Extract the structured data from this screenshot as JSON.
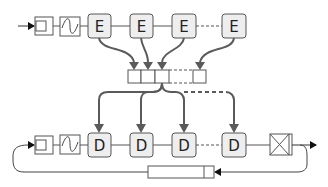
{
  "colors": {
    "stroke": "#555555",
    "arrow": "#5a5a5a",
    "node_fill": "#eeeeee",
    "box_fill": "#ffffff",
    "background": "#ffffff",
    "text": "#222222"
  },
  "encoder_row": {
    "input_block": "register",
    "filter_block": "sine-wave",
    "nodes": [
      {
        "label": "E"
      },
      {
        "label": "E"
      },
      {
        "label": "E"
      },
      {
        "label": "E"
      }
    ]
  },
  "buffer": {
    "cells_visible": 4,
    "gap": "dashed"
  },
  "decoder_row": {
    "input_block": "register",
    "filter_block": "sine-wave",
    "nodes": [
      {
        "label": "D"
      },
      {
        "label": "D"
      },
      {
        "label": "D"
      },
      {
        "label": "D"
      }
    ],
    "output_block": "crossed-box"
  },
  "feedback": {
    "delay_block": "long-register"
  }
}
